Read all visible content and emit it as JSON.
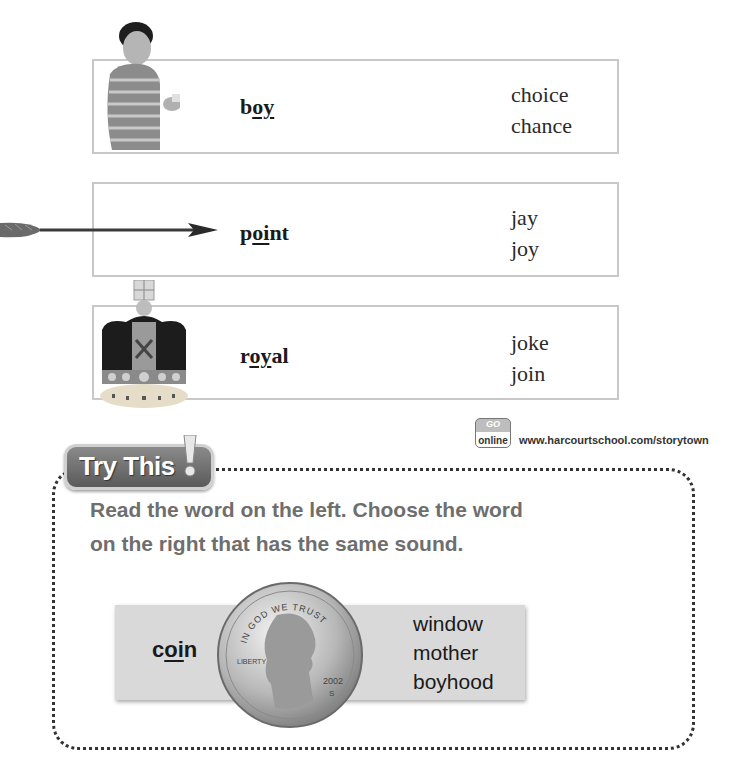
{
  "rows": [
    {
      "image": "boy-holding-game-photo",
      "key_word": {
        "before": "b",
        "underlined": "oy",
        "after": ""
      },
      "choices": [
        "choice",
        "chance"
      ]
    },
    {
      "image": "arrow-photo",
      "key_word": {
        "before": "p",
        "underlined": "oi",
        "after": "nt"
      },
      "choices": [
        "jay",
        "joy"
      ]
    },
    {
      "image": "royal-crown-photo",
      "key_word": {
        "before": "r",
        "underlined": "oy",
        "after": "al"
      },
      "choices": [
        "joke",
        "join"
      ]
    }
  ],
  "go_online": {
    "badge_top": "GO",
    "badge_bottom": "online",
    "url": "www.harcourtschool.com/storytown"
  },
  "try_this": {
    "title": "Try This",
    "instructions": "Read the word on the left. Choose the word on the right that has the same sound.",
    "example": {
      "image": "penny-coin-photo",
      "coin_text": {
        "motto": "IN GOD WE TRUST",
        "left": "LIBERTY",
        "year": "2002",
        "mint": "S"
      },
      "key_word": {
        "before": "c",
        "underlined": "oi",
        "after": "n"
      },
      "choices": [
        "window",
        "mother",
        "boyhood"
      ]
    }
  },
  "colors": {
    "box_border": "#c8c8c8",
    "badge_fill": "#6e6e6e",
    "instruction_text": "#6e6e6e",
    "panel_fill": "#d9d9d9"
  }
}
